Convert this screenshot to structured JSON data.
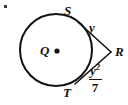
{
  "figure": {
    "type": "geometry-diagram",
    "background_color": "#ffffff",
    "stroke_color": "#121212",
    "labels": {
      "center": "Q",
      "tangent_point_upper": "S",
      "tangent_point_lower": "T",
      "external_point": "R",
      "tangent_length_upper": "y",
      "tangent_length_lower_numerator": "y",
      "tangent_length_lower_exponent": "2",
      "tangent_length_lower_denominator": "7"
    },
    "geometry": {
      "circle_center_x": 56,
      "circle_center_y": 50,
      "circle_radius": 36,
      "center_dot_x": 57,
      "center_dot_y": 51,
      "center_dot_radius": 2.6,
      "external_point_x": 111,
      "external_point_y": 52,
      "tangent_point_upper_x": 78,
      "tangent_point_upper_y": 22,
      "tangent_point_lower_x": 75,
      "tangent_point_lower_y": 84,
      "stroke_width_circle": 2,
      "stroke_width_tangent": 1.6
    }
  }
}
